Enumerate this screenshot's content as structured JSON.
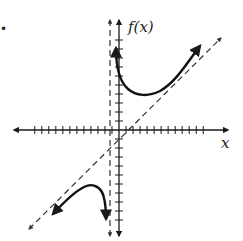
{
  "figure": {
    "marker": "•",
    "y_axis_label": "f(x)",
    "x_axis_label": "x",
    "colors": {
      "ink": "#1a1a1a",
      "asymptote": "#333333",
      "background": "#ffffff"
    },
    "origin_px": [
      119,
      130
    ],
    "unit_px": 9,
    "x_ticks": [
      -12,
      -11,
      -10,
      -9,
      -8,
      -7,
      -6,
      -5,
      -4,
      -3,
      -2,
      -1,
      1,
      2,
      3,
      4,
      5,
      6,
      7,
      8,
      9,
      10,
      11,
      12
    ],
    "y_ticks": [
      -10,
      -9,
      -8,
      -7,
      -6,
      -5,
      -4,
      -3,
      -2,
      -1,
      1,
      2,
      3,
      4,
      5,
      6,
      7,
      8,
      9,
      10
    ]
  },
  "chart_data": {
    "type": "line",
    "title": "",
    "xlabel": "x",
    "ylabel": "f(x)",
    "grid": false,
    "xlim": [
      -12.5,
      12.5
    ],
    "ylim": [
      -11,
      11
    ],
    "asymptotes": [
      {
        "kind": "vertical",
        "equation": "x = -1",
        "style": "dashed"
      },
      {
        "kind": "slant",
        "equation": "y = x - 1",
        "style": "dashed"
      }
    ],
    "series": [
      {
        "name": "upper branch (x > -1)",
        "points": [
          [
            -0.3,
            9.1
          ],
          [
            0,
            6.5
          ],
          [
            0.5,
            4.6
          ],
          [
            1.5,
            3.7
          ],
          [
            2.3,
            3.8
          ],
          [
            4,
            5.0
          ],
          [
            6,
            6.6
          ],
          [
            9,
            9.4
          ]
        ],
        "arrows": "both ends"
      },
      {
        "name": "lower branch (x < -1)",
        "points": [
          [
            -7.2,
            -9.4
          ],
          [
            -5.5,
            -7.6
          ],
          [
            -4,
            -6.1
          ],
          [
            -3.2,
            -5.8
          ],
          [
            -2.2,
            -6.4
          ],
          [
            -1.5,
            -7.7
          ],
          [
            -1.3,
            -10.0
          ]
        ],
        "arrows": "both ends"
      }
    ]
  }
}
